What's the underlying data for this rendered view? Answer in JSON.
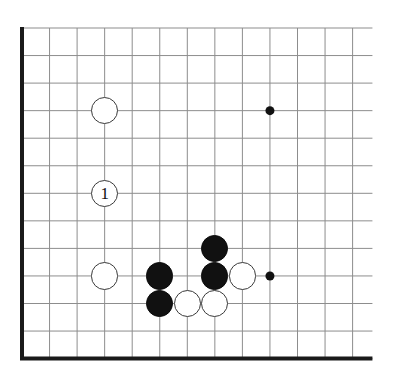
{
  "diagram": {
    "board": {
      "style": "go-goban",
      "visible_columns": 13,
      "visible_rows": 13,
      "origin_x": 22,
      "origin_y": 28,
      "spacing": 27.55,
      "line_color": "#8d8d8d",
      "line_width": 1,
      "edge_color": "#1a1a1a",
      "edge_width": 4,
      "edge_left": true,
      "edge_bottom": true,
      "edge_top": false,
      "edge_right": false,
      "background_color": "#ffffff"
    },
    "star_points": {
      "color": "#111111",
      "radius": 4.5,
      "points": [
        {
          "name": "star-point-upper-right",
          "col": 9,
          "row": 3
        },
        {
          "name": "star-point-lower-right",
          "col": 9,
          "row": 9
        }
      ]
    },
    "stones": {
      "radius": 13.6,
      "black_color": "#111111",
      "white_color": "#ffffff",
      "white_outline_color": "#3a3a3a",
      "items": [
        {
          "name": "white-stone-upper-left",
          "color": "white",
          "col": 3,
          "row": 3,
          "label": ""
        },
        {
          "name": "white-stone-move-1",
          "color": "white",
          "col": 3,
          "row": 6,
          "label": "1"
        },
        {
          "name": "white-stone-left-lower",
          "color": "white",
          "col": 3,
          "row": 9,
          "label": ""
        },
        {
          "name": "black-stone-top-of-group",
          "color": "black",
          "col": 7,
          "row": 8,
          "label": ""
        },
        {
          "name": "black-stone-left-of-group",
          "color": "black",
          "col": 5,
          "row": 9,
          "label": ""
        },
        {
          "name": "black-stone-center-of-group",
          "color": "black",
          "col": 7,
          "row": 9,
          "label": ""
        },
        {
          "name": "white-stone-right-of-group",
          "color": "white",
          "col": 8,
          "row": 9,
          "label": ""
        },
        {
          "name": "black-stone-lower-left-of-group",
          "color": "black",
          "col": 5,
          "row": 10,
          "label": ""
        },
        {
          "name": "white-stone-bottom-left",
          "color": "white",
          "col": 6,
          "row": 10,
          "label": ""
        },
        {
          "name": "white-stone-bottom-right",
          "color": "white",
          "col": 7,
          "row": 10,
          "label": ""
        }
      ]
    },
    "move_numbers": [
      "1"
    ]
  }
}
